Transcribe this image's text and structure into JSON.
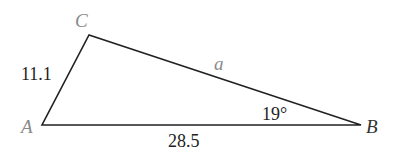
{
  "diagram": {
    "type": "triangle",
    "vertices": {
      "A": {
        "label": "A",
        "x": 42,
        "y": 125
      },
      "B": {
        "label": "B",
        "x": 361,
        "y": 125
      },
      "C": {
        "label": "C",
        "x": 89,
        "y": 35
      }
    },
    "sides": {
      "AC": {
        "label": "11.1"
      },
      "AB": {
        "label": "28.5"
      },
      "BC": {
        "label": "a"
      }
    },
    "angles": {
      "B": {
        "label": "19°"
      }
    },
    "colors": {
      "line": "#222222",
      "vertex_label_gray": "#8a8a8a",
      "text": "#222222"
    }
  }
}
